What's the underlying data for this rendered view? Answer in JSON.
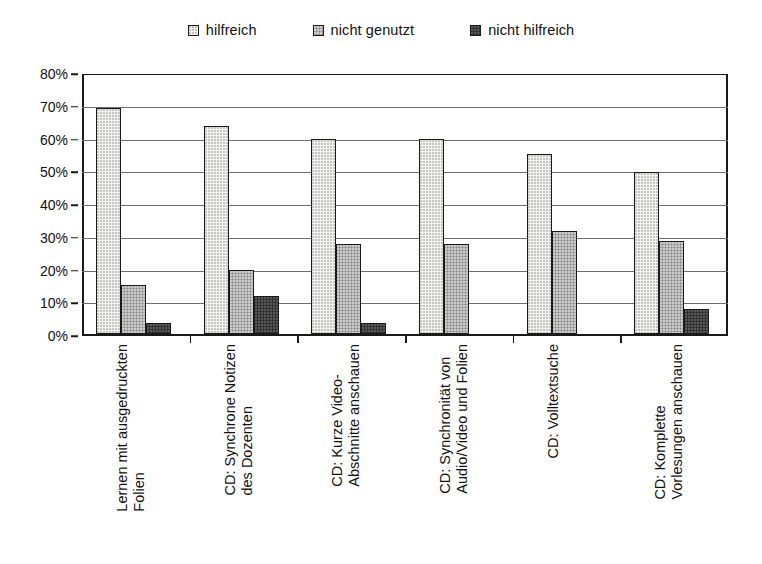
{
  "chart_data": {
    "type": "bar",
    "title": "",
    "subtitle": "",
    "xlabel": "",
    "ylabel": "",
    "ylim": [
      0,
      80
    ],
    "ytick_step": 10,
    "ytick_labels": [
      "0%",
      "10%",
      "20%",
      "30%",
      "40%",
      "50%",
      "60%",
      "70%",
      "80%"
    ],
    "ytick_values": [
      0,
      10,
      20,
      30,
      40,
      50,
      60,
      70,
      80
    ],
    "grid": true,
    "legend_position": "top-center",
    "value_unit": "%",
    "categories": [
      "Lernen mit ausgedruckten Folien",
      "CD: Synchrone Notizen des Dozenten",
      "CD: Kurze Video-Abschnitte anschauen",
      "CD: Synchronität von Audio/Video und Folien",
      "CD: Volltextsuche",
      "CD: Komplette Vorlesungen anschauen"
    ],
    "category_lines": [
      [
        "Lernen mit ausgedruckten",
        "Folien"
      ],
      [
        "CD: Synchrone Notizen",
        "des Dozenten"
      ],
      [
        "CD: Kurze Video-",
        "Abschnitte anschauen"
      ],
      [
        "CD: Synchronität von",
        "Audio/Video und Folien"
      ],
      [
        "CD: Volltextsuche",
        ""
      ],
      [
        "CD: Komplette",
        "Vorlesungen anschauen"
      ]
    ],
    "series": [
      {
        "name": "hilfreich",
        "color": "#f2f2f0",
        "values": [
          69,
          63.5,
          59.5,
          59.5,
          55,
          49.5
        ]
      },
      {
        "name": "nicht genutzt",
        "color": "#a6a6a6",
        "values": [
          15,
          19.5,
          27.5,
          27.5,
          31.5,
          28.5
        ]
      },
      {
        "name": "nicht hilfreich",
        "color": "#323232",
        "values": [
          3.5,
          11.5,
          3.5,
          0,
          0,
          7.5
        ]
      }
    ]
  },
  "legend": {
    "items": [
      {
        "label": "hilfreich",
        "swatch": "white-square-swatch"
      },
      {
        "label": "nicht genutzt",
        "swatch": "gray-square-swatch"
      },
      {
        "label": "nicht hilfreich",
        "swatch": "dark-square-swatch"
      }
    ]
  }
}
